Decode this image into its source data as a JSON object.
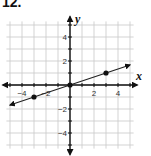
{
  "problem": {
    "number": "12."
  },
  "chart_data": {
    "type": "line",
    "title": "",
    "xlabel": "x",
    "ylabel": "y",
    "xlim": [
      -5.5,
      5.5
    ],
    "ylim": [
      -5.5,
      5.5
    ],
    "grid": true,
    "x_tick_labels": [
      "-4",
      "-2",
      "2",
      "4"
    ],
    "y_tick_labels": [
      "4",
      "2",
      "-2",
      "-4"
    ],
    "series": [
      {
        "name": "line",
        "equation": "y = x/3",
        "x": [
          -5,
          5
        ],
        "y": [
          -1.667,
          1.667
        ],
        "arrows": "both"
      }
    ],
    "points": [
      {
        "x": -3,
        "y": -1
      },
      {
        "x": 0,
        "y": 0
      },
      {
        "x": 3,
        "y": 1
      }
    ],
    "colors": {
      "grid": "#c8c8c8",
      "axis": "#111111",
      "line": "#222222",
      "point": "#111111"
    }
  }
}
